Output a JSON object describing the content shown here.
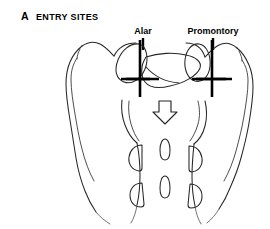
{
  "figure": {
    "panel_letter": "A",
    "title": "ENTRY SITES",
    "background_color": "#ffffff",
    "line_color": "#262626",
    "marker_color": "#000000"
  },
  "labels": {
    "alar": "Alar",
    "promontory": "Promontory"
  },
  "markers": [
    {
      "name": "alar",
      "label": "Alar",
      "center_x": 140,
      "center_y": 79,
      "vertical_top": 40,
      "vertical_bottom": 97,
      "horizontal_left": 122,
      "horizontal_right": 158
    },
    {
      "name": "promontory",
      "label": "Promontory",
      "center_x": 212,
      "center_y": 79,
      "vertical_top": 40,
      "vertical_bottom": 97,
      "horizontal_left": 192,
      "horizontal_right": 232
    }
  ],
  "arrow": {
    "name": "midline-insertion-arrow",
    "direction": "down",
    "style": "hollow-outline",
    "tip_x": 165,
    "tip_y": 120
  },
  "foramina": {
    "description": "sacral foramina pairs",
    "rows": 2,
    "sides": [
      "left",
      "right"
    ]
  }
}
